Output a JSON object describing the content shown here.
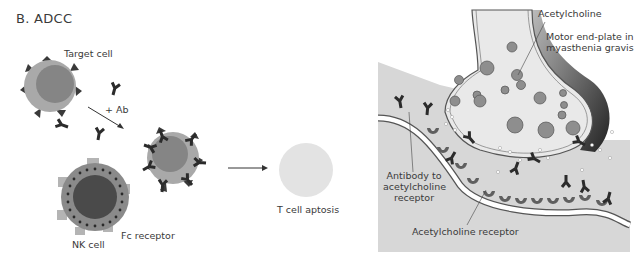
{
  "panel_b": {
    "title": "B. ADCC",
    "labels": {
      "target_cell": "Target cell",
      "plus_ab": "+ Ab",
      "nk_cell": "NK cell",
      "fc_receptor": "Fc receptor",
      "t_cell_apoptosis": "T cell aptosis"
    }
  },
  "panel_mg": {
    "labels": {
      "acetylcholine": "Acetylcholine",
      "motor_endplate_line1": "Motor end-plate in",
      "motor_endplate_line2": "myasthenia gravis",
      "antibody_line1": "Antibody to",
      "antibody_line2": "acetylcholine",
      "antibody_line3": "receptor",
      "ach_receptor": "Acetylcholine receptor"
    }
  },
  "colors": {
    "cell_outer": "#a9a9a9",
    "cell_inner": "#858585",
    "nk_inner": "#4a4a4a",
    "antibody": "#2b2b2b",
    "apoptotic": "#e3e3e3",
    "muscle_bg": "#d7d7d7",
    "terminal_fill": "#e9e9e9",
    "receptor": "#5f5f5f",
    "vesicle": "#8e8e8e"
  }
}
